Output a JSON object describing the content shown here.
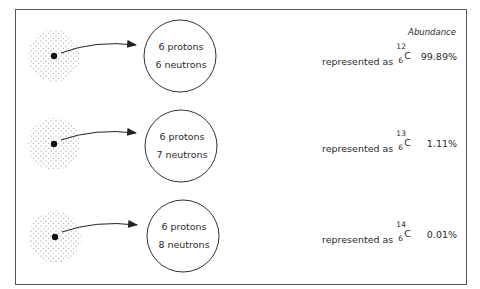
{
  "header": {
    "abundance_label": "Abundance"
  },
  "isotopes": [
    {
      "protons": "6 protons",
      "neutrons": "6 neutrons",
      "represented_prefix": "represented as",
      "mass_number": "12",
      "atomic_number": "6",
      "symbol": "C",
      "abundance": "99.89%"
    },
    {
      "protons": "6 protons",
      "neutrons": "7 neutrons",
      "represented_prefix": "represented as",
      "mass_number": "13",
      "atomic_number": "6",
      "symbol": "C",
      "abundance": "1.11%"
    },
    {
      "protons": "6 protons",
      "neutrons": "8 neutrons",
      "represented_prefix": "represented as",
      "mass_number": "14",
      "atomic_number": "6",
      "symbol": "C",
      "abundance": "0.01%"
    }
  ],
  "colors": {
    "ink": "#222222",
    "frame": "#555555",
    "background": "#ffffff"
  }
}
